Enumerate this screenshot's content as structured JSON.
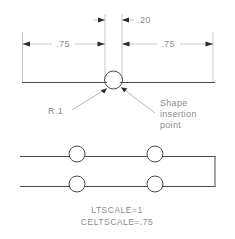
{
  "drawing": {
    "title": "Shape insertion point dimensioned detail",
    "colors": {
      "object_line": "#4a4a4a",
      "dimension_line": "#b0b0b0",
      "text": "#8c8c8c",
      "background": "#ffffff"
    },
    "upper_view": {
      "dimensions": [
        {
          "id": "dim-gap-top",
          "value": ".20",
          "x": 137,
          "y": 19
        },
        {
          "id": "dim-left",
          "value": ".75",
          "x": 63,
          "y": 43
        },
        {
          "id": "dim-right",
          "value": ".75",
          "x": 168,
          "y": 43
        }
      ],
      "callouts": [
        {
          "id": "radius-note",
          "value": "R.1",
          "x": 58,
          "y": 112
        }
      ],
      "insertion_note": {
        "id": "shape-insertion-note",
        "lines": [
          "Shape",
          "insertion",
          "point"
        ],
        "x": 160,
        "y": 103
      }
    },
    "lower_view": {
      "circles_top_row": 2,
      "circles_bottom_row": 2,
      "caption": {
        "line1": "LTSCALE=1",
        "line2": "CELTSCALE=.75"
      }
    }
  }
}
